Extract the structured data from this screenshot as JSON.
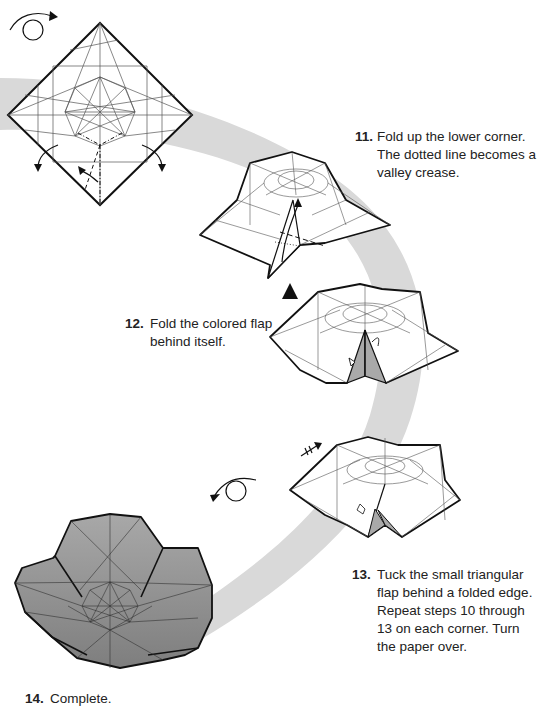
{
  "figure": {
    "band_color": "#d9d9d9",
    "paper_color": "#ffffff",
    "colored_flap_color": "#a9a9a9",
    "finished_model_color": "#9a9a9a",
    "line_color": "#1a1a1a"
  },
  "steps": [
    {
      "number": "11.",
      "text": "Fold up the lower corner. The dotted line becomes a valley crease."
    },
    {
      "number": "12.",
      "text": "Fold the colored flap behind itself."
    },
    {
      "number": "13.",
      "text": "Tuck the small triangular flap behind a folded edge. Repeat steps 10 through 13 on each corner. Turn the paper over."
    },
    {
      "number": "14.",
      "text": "Complete."
    }
  ],
  "symbols": {
    "turn_over_top": "turn-over-arrow",
    "turn_over_bottom": "turn-over-arrow",
    "push_arrow": "push-triangle",
    "repeat_arrow": "repeat-arrow"
  }
}
